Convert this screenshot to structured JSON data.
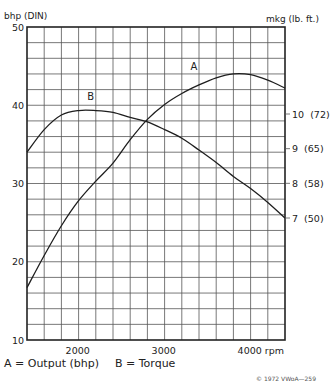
{
  "chart_data": {
    "type": "line",
    "title": "",
    "xlabel": "rpm",
    "ylabel_left": "bhp (DIN)",
    "ylabel_right": "mkg (lb. ft.)",
    "xlim": [
      1400,
      4400
    ],
    "ylim_left": [
      10,
      50
    ],
    "ylim_right_mkg": [
      5.5,
      11.2
    ],
    "grid": true,
    "grid_x_step": 200,
    "grid_y_step_bhp": 2,
    "x_ticks": [
      {
        "value": 2000,
        "label": "2000"
      },
      {
        "value": 3000,
        "label": "3000"
      },
      {
        "value": 4000,
        "label": "4000 rpm"
      }
    ],
    "y_ticks_left": [
      {
        "value": 10,
        "label": "10"
      },
      {
        "value": 20,
        "label": "20"
      },
      {
        "value": 30,
        "label": "30"
      },
      {
        "value": 40,
        "label": "40"
      },
      {
        "value": 50,
        "label": "50"
      }
    ],
    "y_ticks_right": [
      {
        "value": 10,
        "label": "10  (72)"
      },
      {
        "value": 9,
        "label": "9  (65)"
      },
      {
        "value": 8,
        "label": "8  (58)"
      },
      {
        "value": 7,
        "label": "7  (50)"
      }
    ],
    "series": [
      {
        "name": "A",
        "description": "Output (bhp)",
        "axis": "left",
        "label_at": {
          "x": 3300,
          "y": 44.5
        },
        "x": [
          1400,
          1600,
          1800,
          2000,
          2200,
          2400,
          2600,
          2800,
          3000,
          3200,
          3400,
          3600,
          3800,
          4000,
          4200,
          4400
        ],
        "values": [
          16.7,
          20.8,
          24.6,
          27.8,
          30.3,
          32.6,
          35.6,
          38.2,
          40.1,
          41.5,
          42.6,
          43.5,
          44.0,
          43.9,
          43.2,
          42.2
        ]
      },
      {
        "name": "B",
        "description": "Torque",
        "axis": "right",
        "label_at": {
          "x": 2100,
          "y": 10.4
        },
        "x": [
          1400,
          1600,
          1800,
          2000,
          2200,
          2400,
          2600,
          2800,
          3000,
          3200,
          3400,
          3600,
          3800,
          4000,
          4200,
          4400
        ],
        "values": [
          8.9,
          9.55,
          9.97,
          10.1,
          10.1,
          10.05,
          9.9,
          9.77,
          9.55,
          9.3,
          8.96,
          8.6,
          8.2,
          7.85,
          7.45,
          7.0
        ]
      }
    ],
    "legend": [
      {
        "label": "A = Output (bhp)"
      },
      {
        "label": "B = Torque"
      }
    ],
    "legend_position": "bottom-left",
    "annotation": "© 1972 VWoA—259"
  }
}
